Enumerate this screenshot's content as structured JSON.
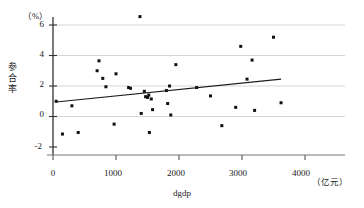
{
  "chart_data": {
    "type": "scatter",
    "title": "",
    "xlabel": "dgdp",
    "ylabel": "参合率",
    "x_unit": "（亿元）",
    "y_unit": "（%）",
    "xlim": [
      0,
      4000
    ],
    "ylim": [
      -2,
      6
    ],
    "x_ticks": [
      0,
      1000,
      2000,
      3000,
      4000
    ],
    "y_ticks": [
      -2,
      0,
      2,
      4,
      6
    ],
    "x_tick_labels": [
      "0",
      "1000",
      "2000",
      "3000",
      "4000"
    ],
    "y_tick_labels": [
      "-2",
      "0",
      "2",
      "4",
      "6"
    ],
    "grid": "horizontal",
    "legend": "none",
    "point_color": "#111111",
    "line_color": "#1a1a1a",
    "grid_color": "#cccccc",
    "axis_color": "#333333",
    "points": [
      {
        "x": 50,
        "y": 1.0
      },
      {
        "x": 150,
        "y": -1.15
      },
      {
        "x": 300,
        "y": 0.7
      },
      {
        "x": 400,
        "y": -1.05
      },
      {
        "x": 700,
        "y": 3.0
      },
      {
        "x": 730,
        "y": 3.65
      },
      {
        "x": 790,
        "y": 2.5
      },
      {
        "x": 840,
        "y": 1.95
      },
      {
        "x": 970,
        "y": -0.5
      },
      {
        "x": 1000,
        "y": 2.8
      },
      {
        "x": 1200,
        "y": 1.9
      },
      {
        "x": 1230,
        "y": 1.85
      },
      {
        "x": 1380,
        "y": 6.55
      },
      {
        "x": 1400,
        "y": 0.2
      },
      {
        "x": 1450,
        "y": 1.65
      },
      {
        "x": 1470,
        "y": 1.3
      },
      {
        "x": 1500,
        "y": 1.25
      },
      {
        "x": 1520,
        "y": 1.4
      },
      {
        "x": 1530,
        "y": -1.05
      },
      {
        "x": 1560,
        "y": 1.15
      },
      {
        "x": 1580,
        "y": 0.45
      },
      {
        "x": 1800,
        "y": 1.7
      },
      {
        "x": 1820,
        "y": 0.85
      },
      {
        "x": 1850,
        "y": 2.0
      },
      {
        "x": 1870,
        "y": 0.1
      },
      {
        "x": 1950,
        "y": 3.4
      },
      {
        "x": 2280,
        "y": 1.9
      },
      {
        "x": 2500,
        "y": 1.35
      },
      {
        "x": 2680,
        "y": -0.6
      },
      {
        "x": 2900,
        "y": 0.6
      },
      {
        "x": 2980,
        "y": 4.6
      },
      {
        "x": 3080,
        "y": 2.45
      },
      {
        "x": 3160,
        "y": 3.7
      },
      {
        "x": 3200,
        "y": 0.4
      },
      {
        "x": 3500,
        "y": 5.2
      },
      {
        "x": 3620,
        "y": 0.9
      }
    ],
    "trend_line": {
      "x_start": 50,
      "y_start": 0.95,
      "x_end": 3620,
      "y_end": 2.45
    }
  }
}
